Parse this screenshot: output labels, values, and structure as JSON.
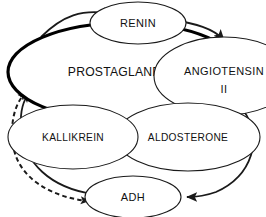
{
  "diagram": {
    "background_color": "#ffffff",
    "line_color": "#1a1a1a",
    "text_color": "#111111",
    "nodes": [
      {
        "id": "prostaglandins",
        "label": "PROSTAGLANDINS",
        "emphasis": true,
        "cx": 125,
        "cy": 72,
        "rx": 117,
        "ry": 49
      },
      {
        "id": "renin",
        "label": "RENIN",
        "emphasis": false,
        "cx": 138,
        "cy": 23,
        "rx": 48,
        "ry": 21
      },
      {
        "id": "angiotensin2",
        "label_line1": "ANGIOTENSIN",
        "label_line2": "II",
        "emphasis": false,
        "cx": 224,
        "cy": 76,
        "rx": 70,
        "ry": 39
      },
      {
        "id": "aldosterone",
        "label": "ALDOSTERONE",
        "emphasis": false,
        "cx": 188,
        "cy": 137,
        "rx": 72,
        "ry": 34
      },
      {
        "id": "kallikrein",
        "label": "KALLIKREIN",
        "emphasis": false,
        "cx": 73,
        "cy": 137,
        "rx": 65,
        "ry": 32
      },
      {
        "id": "adh",
        "label": "ADH",
        "emphasis": false,
        "cx": 133,
        "cy": 197,
        "rx": 48,
        "ry": 21
      }
    ],
    "edges": [
      {
        "id": "prostaglandins-to-renin",
        "from": "prostaglandins",
        "to": "renin",
        "style": "solid",
        "arrow": "single"
      },
      {
        "id": "renin-to-angiotensin2",
        "from": "renin",
        "to": "angiotensin2",
        "style": "solid",
        "arrow": "single"
      },
      {
        "id": "angiotensin2-to-prostaglandins",
        "from": "angiotensin2",
        "to": "prostaglandins",
        "style": "solid",
        "arrow": "single"
      },
      {
        "id": "angiotensin2-to-aldosterone",
        "from": "angiotensin2",
        "to": "aldosterone",
        "style": "solid",
        "arrow": "single"
      },
      {
        "id": "angiotensin2-to-adh",
        "from": "angiotensin2",
        "to": "adh",
        "style": "solid",
        "arrow": "single"
      },
      {
        "id": "aldosterone-to-kallikrein",
        "from": "aldosterone",
        "to": "kallikrein",
        "style": "solid",
        "arrow": "single"
      },
      {
        "id": "kallikrein-to-prostaglandins",
        "from": "kallikrein",
        "to": "prostaglandins",
        "style": "solid",
        "arrow": "single"
      },
      {
        "id": "adh-to-prostaglandins",
        "from": "adh",
        "to": "prostaglandins",
        "style": "solid",
        "arrow": "single"
      },
      {
        "id": "prostaglandins-adh-dashed",
        "from": "prostaglandins",
        "to": "adh",
        "style": "dashed",
        "arrow": "double"
      }
    ]
  }
}
